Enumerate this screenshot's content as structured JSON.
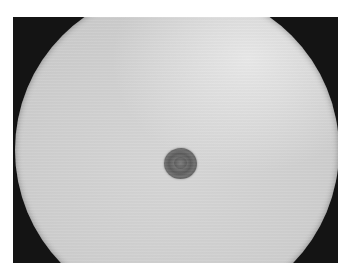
{
  "image": {
    "description": "Brightfield microscope field of view showing a single dark round cell near the center",
    "colors": {
      "background": "#ffffff",
      "frame": "#141414",
      "field": "#d0d0d0",
      "cell": "#5a5a5a"
    },
    "elements": [
      {
        "name": "microscope-field",
        "shape": "circle"
      },
      {
        "name": "cell",
        "shape": "ellipse"
      }
    ]
  }
}
